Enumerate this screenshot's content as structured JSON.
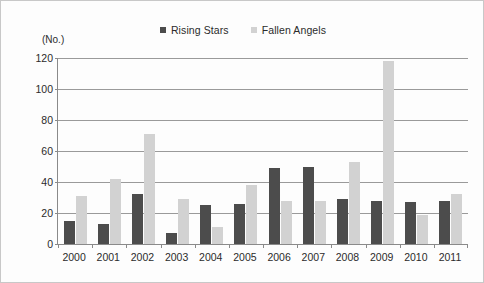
{
  "chart_data": {
    "type": "bar",
    "title": "",
    "subtitle": "",
    "unit_label": "(No.)",
    "xlabel": "",
    "ylabel": "",
    "categories": [
      "2000",
      "2001",
      "2002",
      "2003",
      "2004",
      "2005",
      "2006",
      "2007",
      "2008",
      "2009",
      "2010",
      "2011"
    ],
    "series": [
      {
        "name": "Rising Stars",
        "color": "#4c4c4c",
        "values": [
          15,
          13,
          32,
          7,
          25,
          26,
          49,
          50,
          29,
          28,
          27,
          28
        ]
      },
      {
        "name": "Fallen Angels",
        "color": "#d2d2d2",
        "values": [
          31,
          42,
          71,
          29,
          11,
          38,
          28,
          28,
          53,
          118,
          19,
          32
        ]
      }
    ],
    "ylim": [
      0,
      120
    ],
    "yticks": [
      0,
      20,
      40,
      60,
      80,
      100,
      120
    ],
    "ytick_labels": [
      "0",
      "20",
      "40",
      "60",
      "80",
      "100",
      "120"
    ],
    "grid": true,
    "grid_axis": "y",
    "legend_position": "top-center",
    "legend_marker": "square"
  },
  "legend": {
    "entries": [
      {
        "label": "Rising Stars",
        "swatch_name": "legend-swatch-rising-stars"
      },
      {
        "label": "Fallen Angels",
        "swatch_name": "legend-swatch-fallen-angels"
      }
    ]
  }
}
